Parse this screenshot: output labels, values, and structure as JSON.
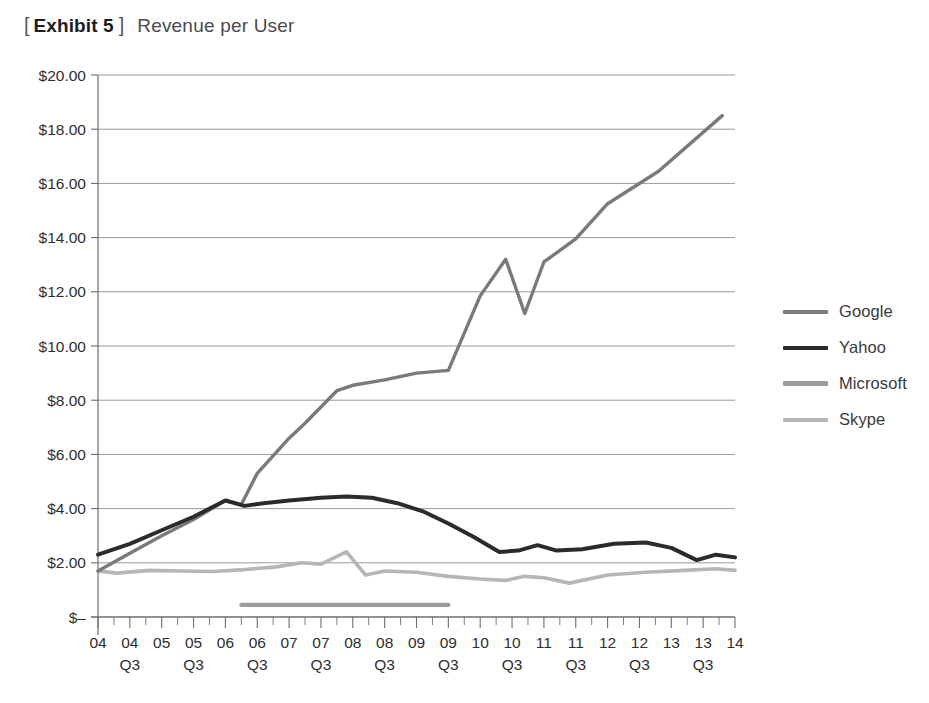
{
  "header": {
    "bracket_open": "[",
    "bracket_close": "]",
    "exhibit_label": "Exhibit 5",
    "title": "Revenue per User"
  },
  "legend": {
    "position": "right",
    "items": [
      {
        "label": "Google",
        "color": "#7a7a7c",
        "weight": "normal"
      },
      {
        "label": "Yahoo",
        "color": "#2b2b2d",
        "weight": "normal"
      },
      {
        "label": "Microsoft",
        "color": "#9b9b9d",
        "weight": "thick"
      },
      {
        "label": "Skype",
        "color": "#b6b6b8",
        "weight": "normal"
      }
    ]
  },
  "chart_data": {
    "type": "line",
    "title": "Revenue per User",
    "xlabel": "",
    "ylabel": "",
    "ylim": [
      0,
      20
    ],
    "ytick_labels": [
      "$20.00",
      "$18.00",
      "$16.00",
      "$14.00",
      "$12.00",
      "$10.00",
      "$8.00",
      "$6.00",
      "$4.00",
      "$2.00",
      "$–"
    ],
    "ytick_values": [
      20,
      18,
      16,
      14,
      12,
      10,
      8,
      6,
      4,
      2,
      0
    ],
    "grid": true,
    "x": [
      "04",
      "04 Q3",
      "05",
      "05 Q3",
      "06",
      "06 Q3",
      "07",
      "07 Q3",
      "08",
      "08 Q3",
      "09",
      "09 Q3",
      "10",
      "10 Q3",
      "11",
      "11 Q3",
      "12",
      "12 Q3",
      "13",
      "13 Q3",
      "14"
    ],
    "xtick_years": [
      "04",
      "04",
      "05",
      "05",
      "06",
      "06",
      "07",
      "07",
      "08",
      "08",
      "09",
      "09",
      "10",
      "10",
      "11",
      "11",
      "12",
      "12",
      "13",
      "13",
      "14"
    ],
    "xtick_quarters": [
      "",
      "Q3",
      "",
      "Q3",
      "",
      "Q3",
      "",
      "Q3",
      "",
      "Q3",
      "",
      "Q3",
      "",
      "Q3",
      "",
      "Q3",
      "",
      "Q3",
      "",
      "Q3",
      ""
    ],
    "minor_ticks_per_label": 2,
    "series": [
      {
        "name": "Google",
        "color": "#7a7a7c",
        "width": 3.4,
        "values": [
          1.7,
          2.35,
          3.0,
          3.6,
          4.3,
          4.15,
          5.3,
          6.6,
          7.15,
          8.35,
          8.55,
          8.75,
          9.0,
          9.1,
          11.85,
          13.2,
          11.2,
          13.1,
          13.95,
          15.25,
          16.45,
          18.5
        ],
        "x_values": [
          0,
          1,
          2,
          3,
          4,
          4.5,
          5,
          6,
          6.5,
          7.5,
          8,
          9,
          10,
          11,
          12,
          12.8,
          13.4,
          14,
          15,
          16,
          17.6,
          19.6
        ]
      },
      {
        "name": "Yahoo",
        "color": "#2b2b2d",
        "width": 4.0,
        "values": [
          2.3,
          2.7,
          3.2,
          3.7,
          4.3,
          4.1,
          4.2,
          4.3,
          4.4,
          4.45,
          4.4,
          4.2,
          3.9,
          3.45,
          2.95,
          2.4,
          2.45,
          2.65,
          2.45,
          2.5,
          2.7,
          2.75,
          2.55,
          2.1,
          2.3,
          2.2
        ],
        "x_values": [
          0,
          1,
          2,
          3,
          4,
          4.6,
          5.2,
          6,
          7,
          7.8,
          8.6,
          9.4,
          10.2,
          11,
          11.8,
          12.6,
          13.2,
          13.8,
          14.4,
          15.2,
          16.2,
          17.2,
          18,
          18.8,
          19.4,
          20
        ]
      },
      {
        "name": "Microsoft",
        "color": "#9b9b9d",
        "width": 4.2,
        "values": [
          0.45,
          0.45
        ],
        "x_values": [
          4.5,
          11.0
        ]
      },
      {
        "name": "Skype",
        "color": "#b6b6b8",
        "width": 3.6,
        "values": [
          1.7,
          1.62,
          1.72,
          1.7,
          1.68,
          1.75,
          1.85,
          2.0,
          1.95,
          2.4,
          1.55,
          1.7,
          1.65,
          1.5,
          1.4,
          1.35,
          1.5,
          1.45,
          1.25,
          1.55,
          1.65,
          1.72,
          1.78,
          1.72
        ],
        "x_values": [
          0,
          0.6,
          1.6,
          2.6,
          3.6,
          4.6,
          5.6,
          6.4,
          7.0,
          7.8,
          8.4,
          9.0,
          10.0,
          11.0,
          12.0,
          12.8,
          13.4,
          14.0,
          14.8,
          16.0,
          17.2,
          18.4,
          19.4,
          20
        ]
      }
    ]
  }
}
